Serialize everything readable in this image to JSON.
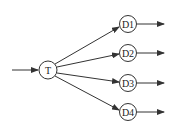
{
  "diagram": {
    "type": "flow",
    "source_node": {
      "id": "T",
      "label": "T",
      "cx": 48,
      "cy": 70,
      "r": 9
    },
    "target_nodes": [
      {
        "id": "D1",
        "label": "D1",
        "cx": 128,
        "cy": 24,
        "r": 8.5
      },
      {
        "id": "D2",
        "label": "D2",
        "cx": 128,
        "cy": 53,
        "r": 8.5
      },
      {
        "id": "D3",
        "label": "D3",
        "cx": 128,
        "cy": 83,
        "r": 8.5
      },
      {
        "id": "D4",
        "label": "D4",
        "cx": 128,
        "cy": 112,
        "r": 8.5
      }
    ],
    "edges": [
      {
        "from": "input",
        "to": "T"
      },
      {
        "from": "T",
        "to": "D1"
      },
      {
        "from": "T",
        "to": "D2"
      },
      {
        "from": "T",
        "to": "D3"
      },
      {
        "from": "T",
        "to": "D4"
      },
      {
        "from": "D1",
        "to": "output"
      },
      {
        "from": "D2",
        "to": "output"
      },
      {
        "from": "D3",
        "to": "output"
      },
      {
        "from": "D4",
        "to": "output"
      }
    ],
    "colors": {
      "stroke": "#333333",
      "background": "#ffffff"
    }
  }
}
